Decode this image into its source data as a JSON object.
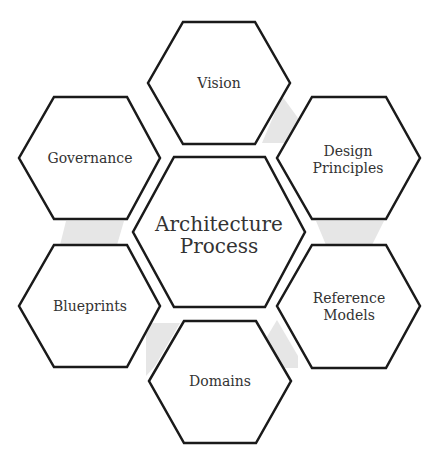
{
  "diagram": {
    "type": "hexagon-cycle",
    "center": {
      "line1": "Architecture",
      "line2": "Process"
    },
    "nodes": [
      {
        "id": "vision",
        "line1": "Vision",
        "line2": ""
      },
      {
        "id": "design-principles",
        "line1": "Design",
        "line2": "Principles"
      },
      {
        "id": "reference-models",
        "line1": "Reference",
        "line2": "Models"
      },
      {
        "id": "domains",
        "line1": "Domains",
        "line2": ""
      },
      {
        "id": "blueprints",
        "line1": "Blueprints",
        "line2": ""
      },
      {
        "id": "governance",
        "line1": "Governance",
        "line2": ""
      }
    ],
    "colors": {
      "hex_fill": "#ffffff",
      "hex_stroke": "#1a1a1a",
      "connector": "#e6e6e6",
      "text": "#333333"
    }
  }
}
